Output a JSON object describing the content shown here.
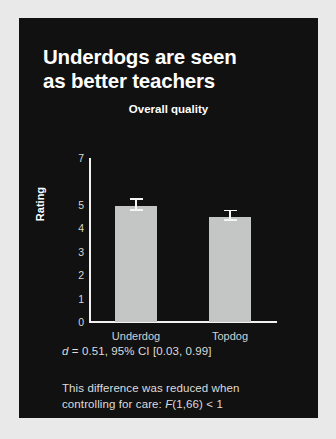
{
  "card": {
    "background_color": "#111111",
    "page_background_color": "#e9e9e9"
  },
  "headline": {
    "line1": "Underdogs are seen",
    "line2": "as better teachers"
  },
  "captions": {
    "stat_prefix": "d",
    "stat_rest": " = 0.51, 95% CI [0.03, 0.99]",
    "note_line1": "This difference was reduced when",
    "note_line2_pre": "controlling for care: ",
    "note_line2_italic": "F",
    "note_line2_post": "(1,66) < 1"
  },
  "chart_data": {
    "type": "bar",
    "title": "Overall quality",
    "xlabel": "",
    "ylabel": "Rating",
    "categories": [
      "Underdog",
      "Topdog"
    ],
    "values": [
      4.95,
      4.5
    ],
    "errors": [
      0.33,
      0.3
    ],
    "ylim": [
      0,
      7
    ],
    "yticks": [
      7,
      6,
      5,
      4,
      3,
      2,
      1,
      0
    ],
    "ytick_labels": [
      "7",
      "",
      "5",
      "4",
      "3",
      "2",
      "1",
      "0"
    ],
    "grid": false,
    "legend": "none",
    "bar_color": "#c3c6c5",
    "error_bar_color": "#f5f5f5",
    "axis_color": "#f2f2f2",
    "text_color": "#d8d8d8"
  }
}
